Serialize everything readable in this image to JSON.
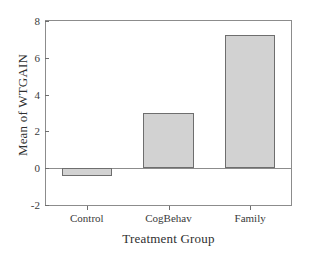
{
  "chart_data": {
    "type": "bar",
    "title": "",
    "subtitle": "",
    "categories": [
      "Control",
      "CogBehav",
      "Family"
    ],
    "values": [
      -0.45,
      3.0,
      7.26
    ],
    "series": [
      {
        "name": "Mean of WTGAIN",
        "values": [
          -0.45,
          3.0,
          7.26
        ]
      }
    ],
    "xlabel": "Treatment Group",
    "ylabel": "Mean of WTGAIN",
    "ylim": [
      -2,
      8
    ],
    "yticks": [
      -2,
      0,
      2,
      4,
      6,
      8
    ],
    "ytick_labels": [
      "-2",
      "0",
      "2",
      "4",
      "6",
      "8"
    ],
    "xtick_labels": [
      "Control",
      "CogBehav",
      "Family"
    ],
    "grid": false,
    "legend": false,
    "legend_position": "none",
    "zero_line": true,
    "annotations": [],
    "colors": {
      "bar_fill": "#d2d2d2",
      "bar_border": "#6e6e6e",
      "axis": "#8c8c8c",
      "text": "#3a3a3a",
      "background": "#ffffff"
    }
  }
}
